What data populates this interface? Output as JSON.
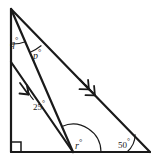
{
  "figure": {
    "kind": "geometry-diagram",
    "background_color": "#ffffff",
    "stroke_color": "#1a1a1a",
    "labels": {
      "q": "q",
      "p": "p",
      "angle_25": "25",
      "r": "r",
      "angle_50": "50",
      "degree_symbol": "°"
    },
    "markers": {
      "right_angle": "right-angle-square",
      "parallel_single": "single-arrow",
      "parallel_double": "double-arrow"
    },
    "vertices": {
      "apex": [
        11,
        9
      ],
      "bottom_left": [
        11,
        152
      ],
      "bottom_right": [
        150,
        152
      ],
      "bottom_mid": [
        73,
        152
      ],
      "left_mid": [
        11,
        62
      ]
    }
  }
}
